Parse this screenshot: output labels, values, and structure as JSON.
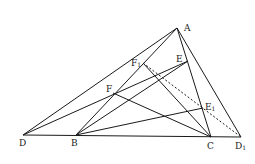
{
  "diagram": {
    "points": {
      "A": {
        "x": 177,
        "y": 28,
        "label": "A",
        "lx": 184,
        "ly": 31
      },
      "D": {
        "x": 23,
        "y": 135,
        "label": "D",
        "lx": 19,
        "ly": 146
      },
      "B": {
        "x": 76,
        "y": 135,
        "label": "B",
        "lx": 71,
        "ly": 146
      },
      "C": {
        "x": 211,
        "y": 137,
        "label": "C",
        "lx": 207,
        "ly": 149
      },
      "D1": {
        "x": 241,
        "y": 137,
        "label": "D",
        "sub": "1",
        "lx": 235,
        "ly": 149
      },
      "E": {
        "x": 188,
        "y": 61,
        "label": "E",
        "lx": 176,
        "ly": 62
      },
      "F1": {
        "x": 143,
        "y": 63,
        "label": "F",
        "sub": "1",
        "lx": 131,
        "ly": 66
      },
      "F": {
        "x": 113,
        "y": 93,
        "label": "F",
        "lx": 106,
        "ly": 92
      },
      "E1": {
        "x": 203,
        "y": 108,
        "label": "E",
        "sub": "1",
        "lx": 205,
        "ly": 110
      }
    },
    "segments": [
      [
        "D",
        "A"
      ],
      [
        "D",
        "D1"
      ],
      [
        "A",
        "D1"
      ],
      [
        "A",
        "C"
      ],
      [
        "B",
        "A"
      ],
      [
        "D",
        "E"
      ],
      [
        "B",
        "E"
      ],
      [
        "B",
        "E1"
      ],
      [
        "F",
        "C"
      ],
      [
        "F1",
        "C"
      ]
    ],
    "dashed_segments": [
      [
        "F1",
        "D1"
      ]
    ]
  }
}
